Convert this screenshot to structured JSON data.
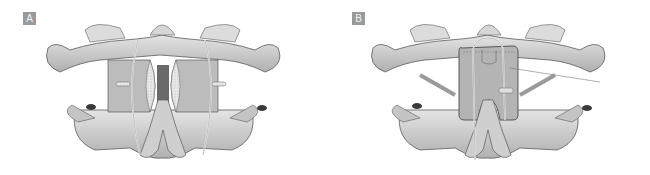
{
  "figure": {
    "panels": [
      {
        "label": "A",
        "content": "Two bilateral bone grafts wedged between C1 posterior arch and C2 lamina, secured with sublaminar wires (Brooks-type fusion)"
      },
      {
        "label": "B",
        "content": "Single H-shaped bone graft over C1 arch and C2 spinous process, secured with a midline wire loop (Gallie-type fusion)"
      }
    ]
  },
  "colors": {
    "background": "#ffffff",
    "label_box": "#9a9a9a",
    "label_text": "#f2f2f2",
    "bone_light": "#d8d8d8",
    "bone_mid": "#b8b8b8",
    "bone_dark": "#8a8a8a",
    "outline": "#5a5a5a"
  }
}
